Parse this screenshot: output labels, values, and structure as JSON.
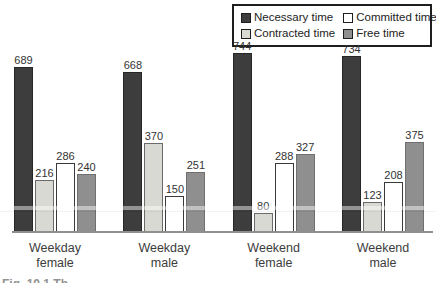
{
  "figure": {
    "caption_fragment": "Fig. 10.1 Th"
  },
  "colors": {
    "necessary": "#3d3d3d",
    "contracted": "#d9d9d4",
    "committed": "#ffffff",
    "free": "#8f8f8f"
  },
  "chart_data": {
    "type": "bar",
    "title": "",
    "xlabel": "",
    "ylabel": "",
    "categories": [
      "Weekday female",
      "Weekday male",
      "Weekend female",
      "Weekend male"
    ],
    "series": [
      {
        "name": "Necessary time",
        "color": "#3d3d3d",
        "values": [
          689,
          668,
          744,
          734
        ]
      },
      {
        "name": "Contracted time",
        "color": "#d9d9d4",
        "values": [
          216,
          370,
          80,
          123
        ]
      },
      {
        "name": "Committed time",
        "color": "#ffffff",
        "values": [
          286,
          150,
          288,
          208
        ]
      },
      {
        "name": "Free time",
        "color": "#8f8f8f",
        "values": [
          240,
          251,
          327,
          375
        ]
      }
    ],
    "bar_order": [
      "Necessary time",
      "Contracted time",
      "Committed time",
      "Free time"
    ],
    "legend": {
      "position": "top-right",
      "display_order": [
        "Necessary time",
        "Committed time",
        "Contracted time",
        "Free time"
      ]
    },
    "value_labels": true,
    "axes": {
      "y_axis_visible": false,
      "x_baseline_visible": true,
      "gridlines": false
    },
    "ylim": [
      0,
      800
    ],
    "px_per_unit": 0.24
  }
}
